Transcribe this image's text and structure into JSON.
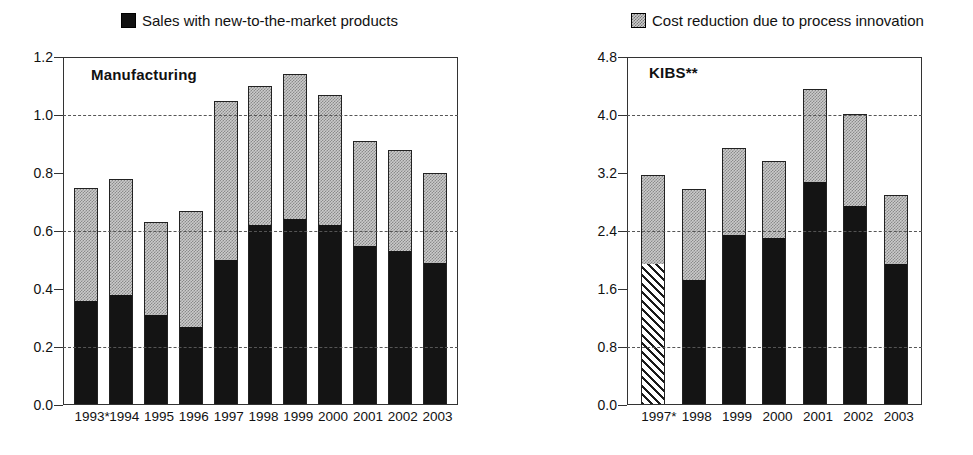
{
  "legend": {
    "items": [
      {
        "label": "Sales with new-to-the-market products",
        "marker": "solid-square-icon",
        "color": "#141414"
      },
      {
        "label": "Cost reduction due to process innovation",
        "marker": "dotted-square-icon",
        "color": "#cbcbcb"
      }
    ]
  },
  "chart_data": [
    {
      "type": "bar",
      "title": "Manufacturing",
      "stacked": true,
      "xlabel": "",
      "ylabel": "",
      "ylim": [
        0.0,
        1.2
      ],
      "yticks": [
        "0.0",
        "0.2",
        "0.4",
        "0.6",
        "0.8",
        "1.0",
        "1.2"
      ],
      "ytick_values": [
        0.0,
        0.2,
        0.4,
        0.6,
        0.8,
        1.0,
        1.2
      ],
      "grid": true,
      "legend_position": "top",
      "categories": [
        "1993*",
        "1994",
        "1995",
        "1996",
        "1997",
        "1998",
        "1999",
        "2000",
        "2001",
        "2002",
        "2003"
      ],
      "series": [
        {
          "name": "Sales with new-to-the-market products",
          "values": [
            0.36,
            0.38,
            0.31,
            0.27,
            0.5,
            0.62,
            0.64,
            0.62,
            0.55,
            0.53,
            0.49
          ]
        },
        {
          "name": "Cost reduction due to process innovation",
          "values": [
            0.39,
            0.4,
            0.32,
            0.4,
            0.55,
            0.48,
            0.5,
            0.45,
            0.36,
            0.35,
            0.31
          ]
        }
      ],
      "totals": [
        0.75,
        0.78,
        0.63,
        0.67,
        1.05,
        1.1,
        1.14,
        1.07,
        0.91,
        0.88,
        0.8
      ]
    },
    {
      "type": "bar",
      "title": "KIBS**",
      "stacked": true,
      "xlabel": "",
      "ylabel": "",
      "ylim": [
        0.0,
        4.8
      ],
      "yticks": [
        "0.0",
        "0.8",
        "1.6",
        "2.4",
        "3.2",
        "4.0",
        "4.8"
      ],
      "ytick_values": [
        0.0,
        0.8,
        1.6,
        2.4,
        3.2,
        4.0,
        4.8
      ],
      "grid": true,
      "legend_position": "top",
      "categories": [
        "1997*",
        "1998",
        "1999",
        "2000",
        "2001",
        "2002",
        "2003"
      ],
      "series": [
        {
          "name": "Sales with new-to-the-market products",
          "values": [
            1.95,
            1.72,
            2.34,
            2.3,
            3.08,
            2.75,
            1.95
          ]
        },
        {
          "name": "Cost reduction due to process innovation",
          "values": [
            1.22,
            1.26,
            1.2,
            1.06,
            1.28,
            1.27,
            0.95
          ]
        }
      ],
      "totals": [
        3.17,
        2.98,
        3.54,
        3.36,
        4.36,
        4.02,
        2.9
      ],
      "notes": "First bar (1997*) lower segment drawn with diagonal hatch pattern"
    }
  ]
}
